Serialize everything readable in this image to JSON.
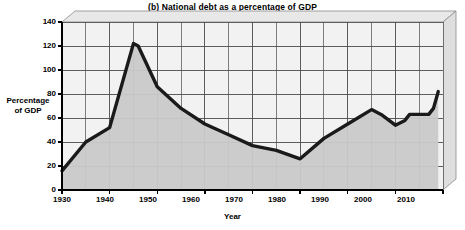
{
  "chart_data": {
    "type": "area",
    "title": "(b) National debt as a percentage of GDP",
    "xlabel": "Year",
    "ylabel": "Percentage of GDP",
    "ylabel_line1": "Percentage",
    "ylabel_line2": "of GDP",
    "xlim": [
      1930,
      2010
    ],
    "ylim": [
      0,
      140
    ],
    "ytick_step": 20,
    "xtick_step": 10,
    "x_gridline_step": 5,
    "grid": true,
    "legend": "none",
    "series_name": "National debt / GDP",
    "yticks": [
      "0",
      "20",
      "40",
      "60",
      "80",
      "100",
      "120",
      "140"
    ],
    "xticks": [
      "1930",
      "1940",
      "1950",
      "1960",
      "1970",
      "1980",
      "1990",
      "2000",
      "2010"
    ],
    "x": [
      1930,
      1935,
      1940,
      1945,
      1946,
      1950,
      1955,
      1960,
      1965,
      1970,
      1975,
      1980,
      1985,
      1990,
      1995,
      1997,
      2000,
      2002,
      2003,
      2005,
      2007,
      2008,
      2009
    ],
    "values": [
      16,
      40,
      52,
      122,
      120,
      86,
      68,
      55,
      46,
      37,
      33,
      26,
      43,
      55,
      67,
      63,
      54,
      58,
      63,
      63,
      63,
      68,
      82
    ],
    "annotations": [
      {
        "text": "World War II",
        "x": 1944,
        "y": 133
      },
      {
        "text": "National debt / GDP",
        "x": 1975,
        "y": 47
      }
    ],
    "colors": {
      "line": "#1a1a1a",
      "fill": "#c9c9c9",
      "grid": "#4d4d4d",
      "plot_background": "#f2f2f2",
      "frame": "#d9d9d9",
      "axis": "#000000"
    }
  }
}
